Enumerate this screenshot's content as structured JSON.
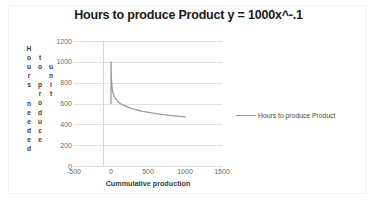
{
  "chart_data": {
    "type": "line",
    "title": "Hours to produce Product y = 1000x^-.1",
    "xlabel": "Cummulative production",
    "ylabel": "Hours needed to produce unit",
    "ylabel_columns": [
      "Hours needed",
      "to produce",
      "unit"
    ],
    "xlim": [
      -500,
      1500
    ],
    "ylim": [
      0,
      1200
    ],
    "xticks": [
      -500,
      0,
      500,
      1000,
      1500
    ],
    "yticks": [
      0,
      200,
      400,
      600,
      800,
      1000,
      1200
    ],
    "grid": "horizontal",
    "legend_position": "right",
    "series": [
      {
        "name": "Hours to produce Product",
        "color": "#9a9a9a",
        "x": [
          1,
          2,
          4,
          8,
          15,
          25,
          40,
          60,
          90,
          130,
          180,
          250,
          330,
          430,
          550,
          680,
          820,
          1000
        ],
        "y": [
          1000,
          933,
          871,
          812,
          749,
          707,
          676,
          646,
          620,
          598,
          579,
          558,
          540,
          524,
          509,
          496,
          484,
          471
        ]
      }
    ]
  },
  "legend": {
    "entries": [
      {
        "label": "Hours to produce Product"
      }
    ]
  }
}
